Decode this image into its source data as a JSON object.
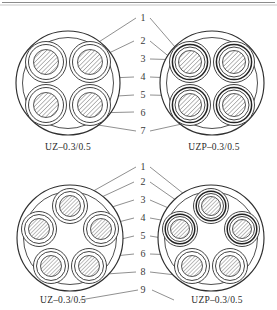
{
  "figure": {
    "type": "technical-cross-section-diagram",
    "background_color": "#ffffff",
    "line_color": "#2f2f2f",
    "hatch_color": "#555555"
  },
  "panels": [
    {
      "id": "top-left",
      "label": "UZ–0.3/0.5",
      "core_count": 4,
      "arrangement": "2x2 square",
      "shielded": false,
      "layers_per_core": [
        "conductor",
        "insulation"
      ]
    },
    {
      "id": "top-right",
      "label": "UZP–0.3/0.5",
      "core_count": 4,
      "arrangement": "2x2 square",
      "shielded": true,
      "layers_per_core": [
        "conductor",
        "insulation",
        "shield"
      ]
    },
    {
      "id": "bottom-left",
      "label": "UZ–0.3/0.5",
      "core_count": 5,
      "arrangement": "pentagon",
      "shielded": false,
      "layers_per_core": [
        "conductor",
        "insulation"
      ]
    },
    {
      "id": "bottom-right",
      "label": "UZP–0.3/0.5",
      "core_count": 5,
      "arrangement": "pentagon",
      "shielded": true,
      "layers_per_core": [
        "conductor",
        "insulation",
        "shield"
      ]
    }
  ],
  "top_section": {
    "leader_numbers": [
      "1",
      "2",
      "3",
      "4",
      "5",
      "6",
      "7"
    ],
    "left_label": "UZ–0.3/0.5",
    "right_label": "UZP–0.3/0.5"
  },
  "bottom_section": {
    "leader_numbers": [
      "1",
      "2",
      "3",
      "4",
      "5",
      "6",
      "8",
      "9"
    ],
    "left_label": "UZ–0.3/0.5",
    "right_label": "UZP–0.3/0.5"
  }
}
